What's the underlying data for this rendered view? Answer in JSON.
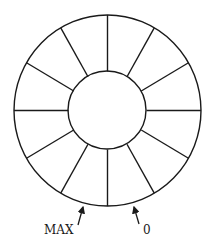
{
  "diagram": {
    "type": "circular-buffer",
    "segments": 12,
    "labels": {
      "max": "MAX",
      "zero": "0"
    },
    "colors": {
      "stroke": "#1a1a1a",
      "background": "#ffffff"
    }
  }
}
